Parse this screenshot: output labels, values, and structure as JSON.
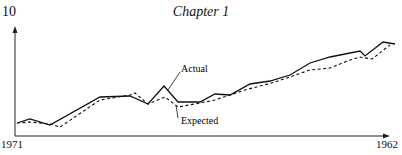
{
  "page": {
    "page_number": "10",
    "chapter_title": "Chapter 1"
  },
  "chart_data": {
    "type": "line",
    "title": "",
    "xlabel": "",
    "ylabel": "",
    "x_tick_labels": [
      "1971",
      "1962"
    ],
    "x_start_label": "1971",
    "x_end_label": "1962",
    "grid": false,
    "legend": "inline annotations",
    "annotations": [
      "Actual",
      "Expected"
    ],
    "series": [
      {
        "name": "Actual",
        "style": "solid",
        "points_px": [
          [
            17,
            123
          ],
          [
            30,
            119
          ],
          [
            50,
            125
          ],
          [
            100,
            97
          ],
          [
            130,
            96
          ],
          [
            148,
            104
          ],
          [
            164,
            86
          ],
          [
            178,
            102
          ],
          [
            200,
            102
          ],
          [
            215,
            94
          ],
          [
            230,
            95
          ],
          [
            250,
            84
          ],
          [
            270,
            81
          ],
          [
            290,
            75
          ],
          [
            310,
            63
          ],
          [
            330,
            57
          ],
          [
            345,
            54
          ],
          [
            360,
            51
          ],
          [
            365,
            56
          ],
          [
            383,
            42
          ],
          [
            395,
            44
          ]
        ]
      },
      {
        "name": "Expected",
        "style": "dashed",
        "points_px": [
          [
            17,
            123
          ],
          [
            30,
            122
          ],
          [
            50,
            124
          ],
          [
            60,
            127
          ],
          [
            100,
            100
          ],
          [
            130,
            95
          ],
          [
            135,
            93
          ],
          [
            148,
            104
          ],
          [
            165,
            97
          ],
          [
            178,
            107
          ],
          [
            200,
            103
          ],
          [
            215,
            100
          ],
          [
            245,
            90
          ],
          [
            275,
            82
          ],
          [
            310,
            70
          ],
          [
            330,
            68
          ],
          [
            350,
            60
          ],
          [
            360,
            57
          ],
          [
            372,
            59
          ],
          [
            390,
            45
          ]
        ]
      }
    ],
    "axis": {
      "origin_px": [
        15,
        136
      ],
      "y_top_px": 28,
      "x_right_px": 388
    },
    "label_actual": "Actual",
    "label_expected": "Expected"
  }
}
